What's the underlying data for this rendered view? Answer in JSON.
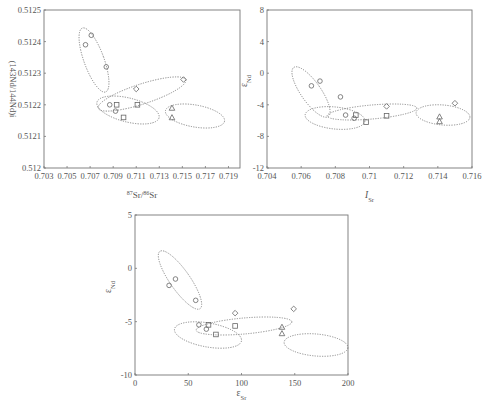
{
  "chart_data": [
    {
      "id": "chart1",
      "type": "scatter",
      "title": "",
      "xlabel": "87Sr/86Sr",
      "xlabel_parts": {
        "sup1": "87",
        "base1": "Sr/",
        "sup2": "86",
        "base2": "Sr"
      },
      "ylabel": "(143Nd/144Nd)i",
      "xlim": [
        0.703,
        0.72
      ],
      "ylim": [
        0.512,
        0.5125
      ],
      "xticks": [
        "0.703",
        "0.705",
        "0.707",
        "0.709",
        "0.711",
        "0.713",
        "0.715",
        "0.717",
        "0.719"
      ],
      "xtick_values": [
        0.703,
        0.705,
        0.707,
        0.709,
        0.711,
        0.713,
        0.715,
        0.717,
        0.719
      ],
      "yticks": [
        "0.512",
        "0.5121",
        "0.5122",
        "0.5123",
        "0.5124",
        "0.5125"
      ],
      "ytick_values": [
        0.512,
        0.5121,
        0.5122,
        0.5123,
        0.5124,
        0.5125
      ],
      "grid": false,
      "legend": null,
      "series": [
        {
          "name": "circle",
          "marker": "circle",
          "points": [
            [
              0.7066,
              0.51239
            ],
            [
              0.7071,
              0.51242
            ],
            [
              0.7084,
              0.51232
            ],
            [
              0.7087,
              0.5122
            ],
            [
              0.7092,
              0.51218
            ]
          ]
        },
        {
          "name": "square",
          "marker": "square",
          "points": [
            [
              0.7093,
              0.5122
            ],
            [
              0.7111,
              0.5122
            ],
            [
              0.7099,
              0.51216
            ]
          ]
        },
        {
          "name": "diamond",
          "marker": "diamond",
          "points": [
            [
              0.711,
              0.51225
            ],
            [
              0.7151,
              0.51228
            ]
          ]
        },
        {
          "name": "triangle",
          "marker": "triangle",
          "points": [
            [
              0.7141,
              0.51219
            ],
            [
              0.7141,
              0.51216
            ]
          ]
        }
      ],
      "annotations": "four dotted ellipses enclosing point groups"
    },
    {
      "id": "chart2",
      "type": "scatter",
      "title": "",
      "xlabel": "ISr",
      "xlabel_parts": {
        "base": "I",
        "sub": "Sr"
      },
      "ylabel": "εNd",
      "ylabel_parts": {
        "base": "ε",
        "sub": "Nd"
      },
      "xlim": [
        0.704,
        0.716
      ],
      "ylim": [
        -12,
        8
      ],
      "xticks": [
        "0.704",
        "0.706",
        "0.708",
        "0.71",
        "0.712",
        "0.714",
        "0.716"
      ],
      "xtick_values": [
        0.704,
        0.706,
        0.708,
        0.71,
        0.712,
        0.714,
        0.716
      ],
      "yticks": [
        "-12",
        "-8",
        "-4",
        "0",
        "4",
        "8"
      ],
      "ytick_values": [
        -12,
        -8,
        -4,
        0,
        4,
        8
      ],
      "grid": false,
      "legend": null,
      "series": [
        {
          "name": "circle",
          "marker": "circle",
          "points": [
            [
              0.7066,
              -1.6
            ],
            [
              0.7071,
              -1.0
            ],
            [
              0.7083,
              -3.0
            ],
            [
              0.7086,
              -5.3
            ],
            [
              0.7091,
              -5.7
            ]
          ]
        },
        {
          "name": "square",
          "marker": "square",
          "points": [
            [
              0.7092,
              -5.3
            ],
            [
              0.711,
              -5.4
            ],
            [
              0.7098,
              -6.2
            ]
          ]
        },
        {
          "name": "diamond",
          "marker": "diamond",
          "points": [
            [
              0.711,
              -4.2
            ],
            [
              0.715,
              -3.8
            ]
          ]
        },
        {
          "name": "triangle",
          "marker": "triangle",
          "points": [
            [
              0.7141,
              -5.5
            ],
            [
              0.7141,
              -6.1
            ]
          ]
        }
      ],
      "annotations": "four dotted ellipses enclosing point groups"
    },
    {
      "id": "chart3",
      "type": "scatter",
      "title": "",
      "xlabel": "εSr",
      "xlabel_parts": {
        "base": "ε",
        "sub": "Sr"
      },
      "ylabel": "εNd",
      "ylabel_parts": {
        "base": "ε",
        "sub": "Nd"
      },
      "xlim": [
        0,
        200
      ],
      "ylim": [
        -10,
        5
      ],
      "xticks": [
        "0",
        "50",
        "100",
        "150",
        "200"
      ],
      "xtick_values": [
        0,
        50,
        100,
        150,
        200
      ],
      "yticks": [
        "-10",
        "-5",
        "0",
        "5"
      ],
      "ytick_values": [
        -10,
        -5,
        0,
        5
      ],
      "grid": false,
      "legend": null,
      "series": [
        {
          "name": "circle",
          "marker": "circle",
          "points": [
            [
              32,
              -1.6
            ],
            [
              38,
              -1.0
            ],
            [
              57,
              -3.0
            ],
            [
              60,
              -5.3
            ],
            [
              67,
              -5.7
            ]
          ]
        },
        {
          "name": "square",
          "marker": "square",
          "points": [
            [
              69,
              -5.3
            ],
            [
              94,
              -5.4
            ],
            [
              76,
              -6.2
            ]
          ]
        },
        {
          "name": "diamond",
          "marker": "diamond",
          "points": [
            [
              94,
              -4.2
            ],
            [
              149,
              -3.8
            ]
          ]
        },
        {
          "name": "triangle",
          "marker": "triangle",
          "points": [
            [
              138,
              -5.5
            ],
            [
              138,
              -6.1
            ]
          ]
        }
      ],
      "annotations": "four dotted ellipses enclosing point groups"
    }
  ]
}
